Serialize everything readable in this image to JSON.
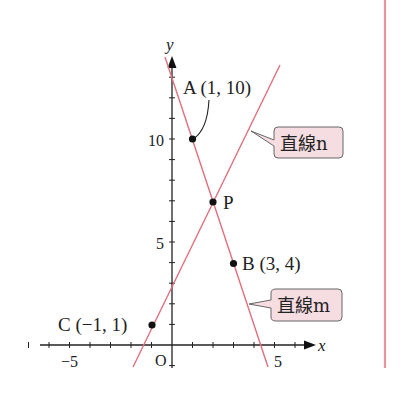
{
  "diagram": {
    "axes": {
      "x_label": "x",
      "y_label": "y",
      "origin_label": "O",
      "x_tick_labels": [
        {
          "value": -5,
          "label": "−5"
        },
        {
          "value": 5,
          "label": "5"
        }
      ],
      "y_tick_labels": [
        {
          "value": 5,
          "label": "5"
        },
        {
          "value": 10,
          "label": "10"
        }
      ],
      "x_range": [
        -7,
        7
      ],
      "y_range": [
        -1,
        13
      ]
    },
    "points": {
      "A": {
        "label": "A (1, 10)",
        "x": 1,
        "y": 10
      },
      "B": {
        "label": "B (3, 4)",
        "x": 3,
        "y": 4
      },
      "C": {
        "label": "C (−1, 1)",
        "x": -1,
        "y": 1
      },
      "P": {
        "label": "P",
        "x": 2,
        "y": 7
      }
    },
    "lines": {
      "n": {
        "label": "直線n",
        "passes_through": [
          "C",
          "P"
        ]
      },
      "m": {
        "label": "直線m",
        "passes_through": [
          "A",
          "B"
        ]
      }
    },
    "colors": {
      "line": "#e0707e",
      "callout_fill": "#f6dde2",
      "callout_stroke": "#666666",
      "margin_rule": "#e7949e"
    }
  }
}
